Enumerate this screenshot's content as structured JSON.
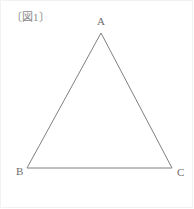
{
  "figure": {
    "caption": "〔図1〕",
    "caption_color": "#8a8a8a",
    "stroke_color": "#808080",
    "background_color": "#ffffff",
    "frame_color": "#f2f2f2"
  },
  "diagram": {
    "shape": "triangle",
    "vertices": [
      {
        "name": "A",
        "label": "A",
        "x": 101,
        "y": 33
      },
      {
        "name": "B",
        "label": "B",
        "x": 27,
        "y": 168
      },
      {
        "name": "C",
        "label": "C",
        "x": 172,
        "y": 168
      }
    ],
    "edges": [
      {
        "name": "AB",
        "from": "A",
        "to": "B"
      },
      {
        "name": "BC",
        "from": "B",
        "to": "C"
      },
      {
        "name": "CA",
        "from": "C",
        "to": "A"
      }
    ]
  }
}
